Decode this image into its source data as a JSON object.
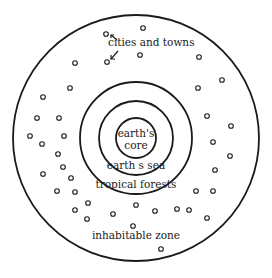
{
  "diagram": {
    "type": "concentric-circles",
    "stroke_color": "#1a1a1a",
    "background": "#ffffff",
    "center": [
      136,
      138
    ],
    "rings": [
      {
        "name": "inhabitable-zone",
        "radius": 123
      },
      {
        "name": "tropical-forests",
        "radius": 56
      },
      {
        "name": "earths-sea",
        "radius": 37
      },
      {
        "name": "earths-core",
        "radius": 20
      }
    ],
    "labels": {
      "core_line1": "earth's",
      "core_line2": "core",
      "sea": "earth s sea",
      "forests": "tropical forests",
      "zone": "inhabitable zone",
      "cities": "cities and towns"
    },
    "settlements": [
      [
        106,
        34
      ],
      [
        143,
        28
      ],
      [
        107,
        62
      ],
      [
        140,
        55
      ],
      [
        75,
        63
      ],
      [
        199,
        57
      ],
      [
        70,
        88
      ],
      [
        222,
        80
      ],
      [
        198,
        88
      ],
      [
        43,
        97
      ],
      [
        37,
        118
      ],
      [
        59,
        118
      ],
      [
        30,
        136
      ],
      [
        64,
        136
      ],
      [
        207,
        116
      ],
      [
        231,
        126
      ],
      [
        42,
        144
      ],
      [
        58,
        154
      ],
      [
        63,
        167
      ],
      [
        43,
        174
      ],
      [
        71,
        178
      ],
      [
        57,
        191
      ],
      [
        75,
        192
      ],
      [
        88,
        203
      ],
      [
        75,
        210
      ],
      [
        87,
        219
      ],
      [
        213,
        142
      ],
      [
        230,
        156
      ],
      [
        215,
        170
      ],
      [
        196,
        191
      ],
      [
        213,
        191
      ],
      [
        113,
        214
      ],
      [
        136,
        205
      ],
      [
        155,
        211
      ],
      [
        177,
        209
      ],
      [
        189,
        210
      ],
      [
        207,
        218
      ],
      [
        133,
        226
      ],
      [
        161,
        249
      ]
    ]
  }
}
